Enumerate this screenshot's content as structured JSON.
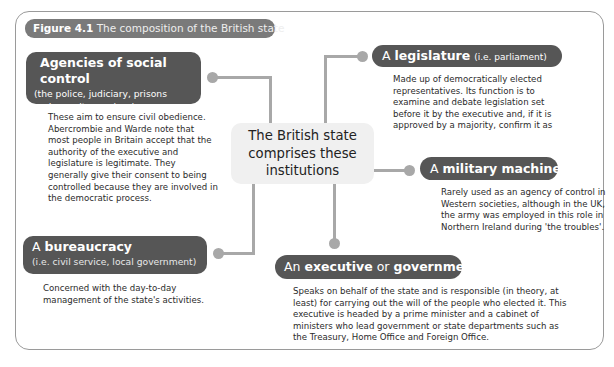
{
  "figure": {
    "label": "Figure 4.1",
    "caption": "The composition of the British state"
  },
  "center": {
    "lines": [
      "The British state",
      "comprises these",
      "institutions"
    ]
  },
  "nodes": {
    "agencies": {
      "title": "Agencies of social control",
      "subtitle_line1": "(the police, judiciary, prisons",
      "subtitle_line2": "and security services)",
      "body": "These aim to ensure civil obedience. Abercrombie and Warde note that most people in Britain accept that the authority of the executive and legislature is legitimate. They generally give their consent to being controlled because they are involved in the democratic process."
    },
    "legislature": {
      "prefix": "A",
      "title": "legislature",
      "suffix": "(i.e. parliament)",
      "body": "Made up of democratically elected representatives. Its function is to examine and debate legislation set before it by the executive and, if it is approved by a majority, confirm it as"
    },
    "military": {
      "prefix": "A",
      "title": "military machine",
      "body": "Rarely used as an agency of control in Western societies, although in the UK, the army was employed in this role in Northern Ireland during 'the troubles'."
    },
    "bureaucracy": {
      "prefix": "A",
      "title": "bureaucracy",
      "subtitle": "(i.e. civil service, local government)",
      "body": "Concerned with the day-to-day management of the state's activities."
    },
    "executive": {
      "prefix": "An",
      "title1": "executive",
      "conj": "or",
      "title2": "government",
      "body": "Speaks on behalf of the state and is responsible (in theory, at least) for carrying out the will of the people who elected it. This executive is headed by a prime minister and a cabinet of ministers who lead government or state departments such as the Treasury, Home Office and Foreign Office."
    }
  },
  "colors": {
    "node_fill": "#565656",
    "connector": "#a8a8a8",
    "center_fill": "#f0f0f0",
    "title_fill": "#7a7a7a"
  }
}
